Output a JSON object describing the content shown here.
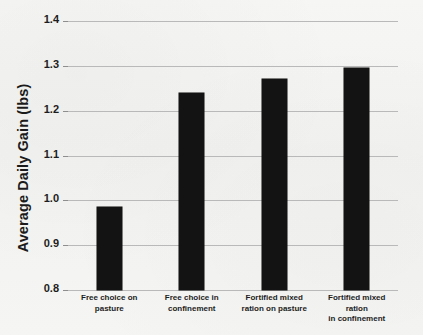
{
  "chart_data": {
    "type": "bar",
    "title": "",
    "subtitle": "",
    "xlabel": "",
    "ylabel": "Average Daily Gain (lbs)",
    "categories": [
      "Free choice on pasture",
      "Free choice in confinement",
      "Fortified mixed ration on pasture",
      "Fortified mixed ration in confinement"
    ],
    "values": [
      0.985,
      1.24,
      1.27,
      1.295
    ],
    "ylim": [
      0.8,
      1.4
    ],
    "ytick_labels": [
      "0.8",
      "0.9",
      "1.0",
      "1.1",
      "1.2",
      "1.3",
      "1.4"
    ],
    "ytick_values": [
      0.8,
      0.9,
      1.0,
      1.1,
      1.2,
      1.3,
      1.4
    ],
    "grid": true,
    "legend": "none",
    "bar_color": "#131313",
    "gridline_color": "#b9b9b9",
    "background_color": "#f4f4f2",
    "text_color": "#1d1d1d"
  },
  "axis": {
    "y_title": "Average Daily Gain (lbs)",
    "ticks": [
      {
        "label": "1.4",
        "value": 1.4
      },
      {
        "label": "1.3",
        "value": 1.3
      },
      {
        "label": "1.2",
        "value": 1.2
      },
      {
        "label": "1.1",
        "value": 1.1
      },
      {
        "label": "1.0",
        "value": 1.0
      },
      {
        "label": "0.9",
        "value": 0.9
      },
      {
        "label": "0.8",
        "value": 0.8
      }
    ]
  },
  "bars": [
    {
      "label_line1": "Free choice on",
      "label_line2": "pasture",
      "value": 0.985
    },
    {
      "label_line1": "Free choice in",
      "label_line2": "confinement",
      "value": 1.24
    },
    {
      "label_line1": "Fortified mixed",
      "label_line2": "ration on pasture",
      "value": 1.27
    },
    {
      "label_line1": "Fortified mixed ration",
      "label_line2": "in confinement",
      "value": 1.295
    }
  ]
}
